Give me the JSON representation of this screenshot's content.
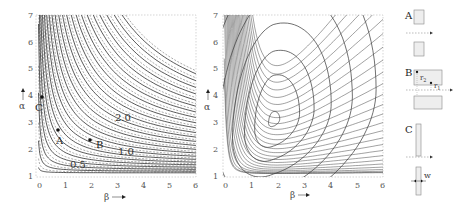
{
  "chart_data": [
    {
      "type": "line",
      "title": "",
      "description": "Contour plot of alpha vs beta with solid and dashed iso-curves (hyperbola-like), labeled contours and marked points",
      "xlabel": "β",
      "ylabel": "α",
      "xlim": [
        0,
        6
      ],
      "ylim": [
        1,
        7
      ],
      "xticks": [
        "0",
        "1",
        "2",
        "3",
        "4",
        "5",
        "6"
      ],
      "yticks": [
        "1",
        "2",
        "3",
        "4",
        "5",
        "6",
        "7"
      ],
      "contour_labels": [
        {
          "text": "0.5",
          "beta": 1.3,
          "alpha": 1.4
        },
        {
          "text": "1.0",
          "beta": 3.0,
          "alpha": 1.9
        },
        {
          "text": "2.0",
          "beta": 2.9,
          "alpha": 3.1
        }
      ],
      "points": [
        {
          "label": "A",
          "beta": 0.75,
          "alpha": 2.7
        },
        {
          "label": "B",
          "beta": 2.0,
          "alpha": 2.4
        },
        {
          "label": "C",
          "beta": 0.1,
          "alpha": 4.0
        }
      ],
      "series": [
        {
          "name": "solid contours",
          "style": "solid"
        },
        {
          "name": "dashed contours",
          "style": "dashed"
        }
      ],
      "grid": false
    },
    {
      "type": "line",
      "title": "",
      "description": "Contour plot with closed elliptical contours around a minimum near beta≈1.9, alpha≈3.0",
      "xlabel": "β",
      "ylabel": "α",
      "xlim": [
        0,
        6
      ],
      "ylim": [
        1,
        7
      ],
      "xticks": [
        "0",
        "1",
        "2",
        "3",
        "4",
        "5",
        "6"
      ],
      "yticks": [
        "1",
        "2",
        "3",
        "4",
        "5",
        "6",
        "7"
      ],
      "minimum": {
        "beta": 1.9,
        "alpha": 3.0
      },
      "grid": false
    }
  ],
  "left": {
    "xlabel": "β",
    "ylabel": "α",
    "xticks": [
      "0",
      "1",
      "2",
      "3",
      "4",
      "5",
      "6"
    ],
    "yticks": [
      "1",
      "2",
      "3",
      "4",
      "5",
      "6",
      "7"
    ],
    "labels": {
      "c05": "0.5",
      "c10": "1.0",
      "c20": "2.0",
      "A": "A",
      "B": "B",
      "C": "C"
    }
  },
  "right": {
    "xlabel": "β",
    "ylabel": "α",
    "xticks": [
      "0",
      "1",
      "2",
      "3",
      "4",
      "5",
      "6"
    ],
    "yticks": [
      "1",
      "2",
      "3",
      "4",
      "5",
      "6",
      "7"
    ]
  },
  "diagrams": {
    "A": "A",
    "B": "B",
    "C": "C",
    "r1": "r",
    "r1_sub": "1",
    "r2": "r",
    "r2_sub": "2",
    "w": "w"
  }
}
